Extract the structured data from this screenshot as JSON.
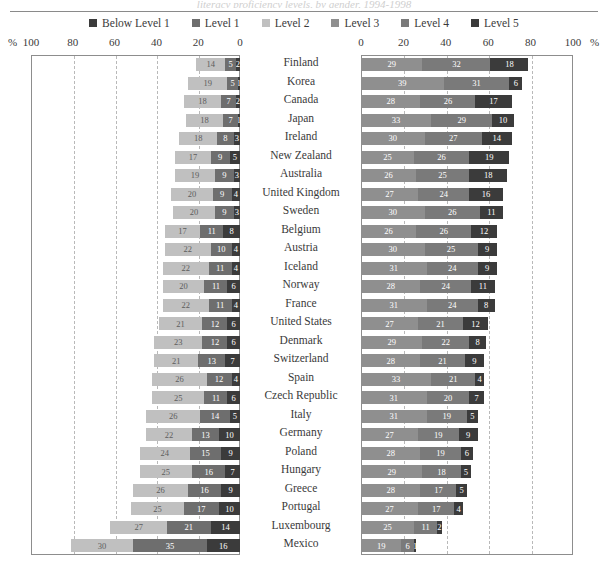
{
  "ghost_header": "literacy proficiency levels, by gender, 1994-1998",
  "legend": {
    "items": [
      {
        "label": "Below Level 1",
        "color": "#3b3b3b",
        "key": "below1"
      },
      {
        "label": "Level 1",
        "color": "#6e6e6e",
        "key": "lvl1"
      },
      {
        "label": "Level 2",
        "color": "#c0c0c0",
        "key": "lvl2"
      },
      {
        "label": "Level 3",
        "color": "#8f8f8f",
        "key": "lvl3"
      },
      {
        "label": "Level 4",
        "color": "#7a7a7a",
        "key": "lvl4"
      },
      {
        "label": "Level 5",
        "color": "#3b3b3b",
        "key": "lvl5"
      }
    ]
  },
  "axes": {
    "left": {
      "unit_prefix": "%",
      "ticks": [
        "100",
        "80",
        "60",
        "40",
        "20",
        "0"
      ]
    },
    "right": {
      "unit_suffix": "%",
      "ticks": [
        "0",
        "20",
        "40",
        "60",
        "80",
        "100"
      ]
    }
  },
  "chart_data": {
    "type": "bar",
    "orientation": "horizontal",
    "layout": "back-to-back diverging stacked bars",
    "xlabel": "%",
    "ylabel": "",
    "xlim_left": [
      0,
      100
    ],
    "xlim_right": [
      0,
      100
    ],
    "grid": true,
    "legend_position": "top-center",
    "left_panel_series": [
      "Below Level 1",
      "Level 1",
      "Level 2"
    ],
    "right_panel_series": [
      "Level 3",
      "Level 4",
      "Level 5"
    ],
    "categories": [
      "Finland",
      "Korea",
      "Canada",
      "Japan",
      "Ireland",
      "New Zealand",
      "Australia",
      "United Kingdom",
      "Sweden",
      "Belgium",
      "Austria",
      "Iceland",
      "Norway",
      "France",
      "United States",
      "Denmark",
      "Switzerland",
      "Spain",
      "Czech Republic",
      "Italy",
      "Germany",
      "Poland",
      "Hungary",
      "Greece",
      "Portugal",
      "Luxembourg",
      "Mexico"
    ],
    "rows": [
      {
        "country": "Finland",
        "below1": 2,
        "lvl1": 5,
        "lvl2": 14,
        "lvl3": 29,
        "lvl4": 32,
        "lvl5": 18
      },
      {
        "country": "Korea",
        "below1": 1,
        "lvl1": 5,
        "lvl2": 19,
        "lvl3": 39,
        "lvl4": 31,
        "lvl5": 6
      },
      {
        "country": "Canada",
        "below1": 2,
        "lvl1": 7,
        "lvl2": 18,
        "lvl3": 28,
        "lvl4": 26,
        "lvl5": 17
      },
      {
        "country": "Japan",
        "below1": 1,
        "lvl1": 7,
        "lvl2": 18,
        "lvl3": 33,
        "lvl4": 29,
        "lvl5": 10
      },
      {
        "country": "Ireland",
        "below1": 3,
        "lvl1": 8,
        "lvl2": 18,
        "lvl3": 30,
        "lvl4": 27,
        "lvl5": 14
      },
      {
        "country": "New Zealand",
        "below1": 5,
        "lvl1": 9,
        "lvl2": 17,
        "lvl3": 25,
        "lvl4": 26,
        "lvl5": 19
      },
      {
        "country": "Australia",
        "below1": 3,
        "lvl1": 9,
        "lvl2": 19,
        "lvl3": 26,
        "lvl4": 25,
        "lvl5": 18
      },
      {
        "country": "United Kingdom",
        "below1": 4,
        "lvl1": 9,
        "lvl2": 20,
        "lvl3": 27,
        "lvl4": 24,
        "lvl5": 16
      },
      {
        "country": "Sweden",
        "below1": 3,
        "lvl1": 9,
        "lvl2": 20,
        "lvl3": 30,
        "lvl4": 26,
        "lvl5": 11
      },
      {
        "country": "Belgium",
        "below1": 8,
        "lvl1": 11,
        "lvl2": 17,
        "lvl3": 26,
        "lvl4": 26,
        "lvl5": 12
      },
      {
        "country": "Austria",
        "below1": 4,
        "lvl1": 10,
        "lvl2": 22,
        "lvl3": 30,
        "lvl4": 25,
        "lvl5": 9
      },
      {
        "country": "Iceland",
        "below1": 4,
        "lvl1": 11,
        "lvl2": 22,
        "lvl3": 31,
        "lvl4": 24,
        "lvl5": 9
      },
      {
        "country": "Norway",
        "below1": 6,
        "lvl1": 11,
        "lvl2": 20,
        "lvl3": 28,
        "lvl4": 24,
        "lvl5": 11
      },
      {
        "country": "France",
        "below1": 4,
        "lvl1": 11,
        "lvl2": 22,
        "lvl3": 31,
        "lvl4": 24,
        "lvl5": 8
      },
      {
        "country": "United States",
        "below1": 6,
        "lvl1": 12,
        "lvl2": 21,
        "lvl3": 27,
        "lvl4": 21,
        "lvl5": 12
      },
      {
        "country": "Denmark",
        "below1": 6,
        "lvl1": 12,
        "lvl2": 23,
        "lvl3": 29,
        "lvl4": 22,
        "lvl5": 8
      },
      {
        "country": "Switzerland",
        "below1": 7,
        "lvl1": 13,
        "lvl2": 21,
        "lvl3": 28,
        "lvl4": 21,
        "lvl5": 9
      },
      {
        "country": "Spain",
        "below1": 4,
        "lvl1": 12,
        "lvl2": 26,
        "lvl3": 33,
        "lvl4": 21,
        "lvl5": 4
      },
      {
        "country": "Czech Republic",
        "below1": 6,
        "lvl1": 11,
        "lvl2": 25,
        "lvl3": 31,
        "lvl4": 20,
        "lvl5": 7
      },
      {
        "country": "Italy",
        "below1": 5,
        "lvl1": 14,
        "lvl2": 26,
        "lvl3": 31,
        "lvl4": 19,
        "lvl5": 5
      },
      {
        "country": "Germany",
        "below1": 10,
        "lvl1": 13,
        "lvl2": 22,
        "lvl3": 27,
        "lvl4": 19,
        "lvl5": 9
      },
      {
        "country": "Poland",
        "below1": 9,
        "lvl1": 15,
        "lvl2": 24,
        "lvl3": 28,
        "lvl4": 19,
        "lvl5": 6
      },
      {
        "country": "Hungary",
        "below1": 7,
        "lvl1": 16,
        "lvl2": 25,
        "lvl3": 29,
        "lvl4": 18,
        "lvl5": 5
      },
      {
        "country": "Greece",
        "below1": 9,
        "lvl1": 16,
        "lvl2": 26,
        "lvl3": 28,
        "lvl4": 17,
        "lvl5": 5
      },
      {
        "country": "Portugal",
        "below1": 10,
        "lvl1": 17,
        "lvl2": 25,
        "lvl3": 27,
        "lvl4": 17,
        "lvl5": 4
      },
      {
        "country": "Luxembourg",
        "below1": 14,
        "lvl1": 21,
        "lvl2": 27,
        "lvl3": 25,
        "lvl4": 11,
        "lvl5": 2
      },
      {
        "country": "Mexico",
        "below1": 16,
        "lvl1": 35,
        "lvl2": 30,
        "lvl3": 19,
        "lvl4": 6,
        "lvl5": 1
      }
    ]
  }
}
